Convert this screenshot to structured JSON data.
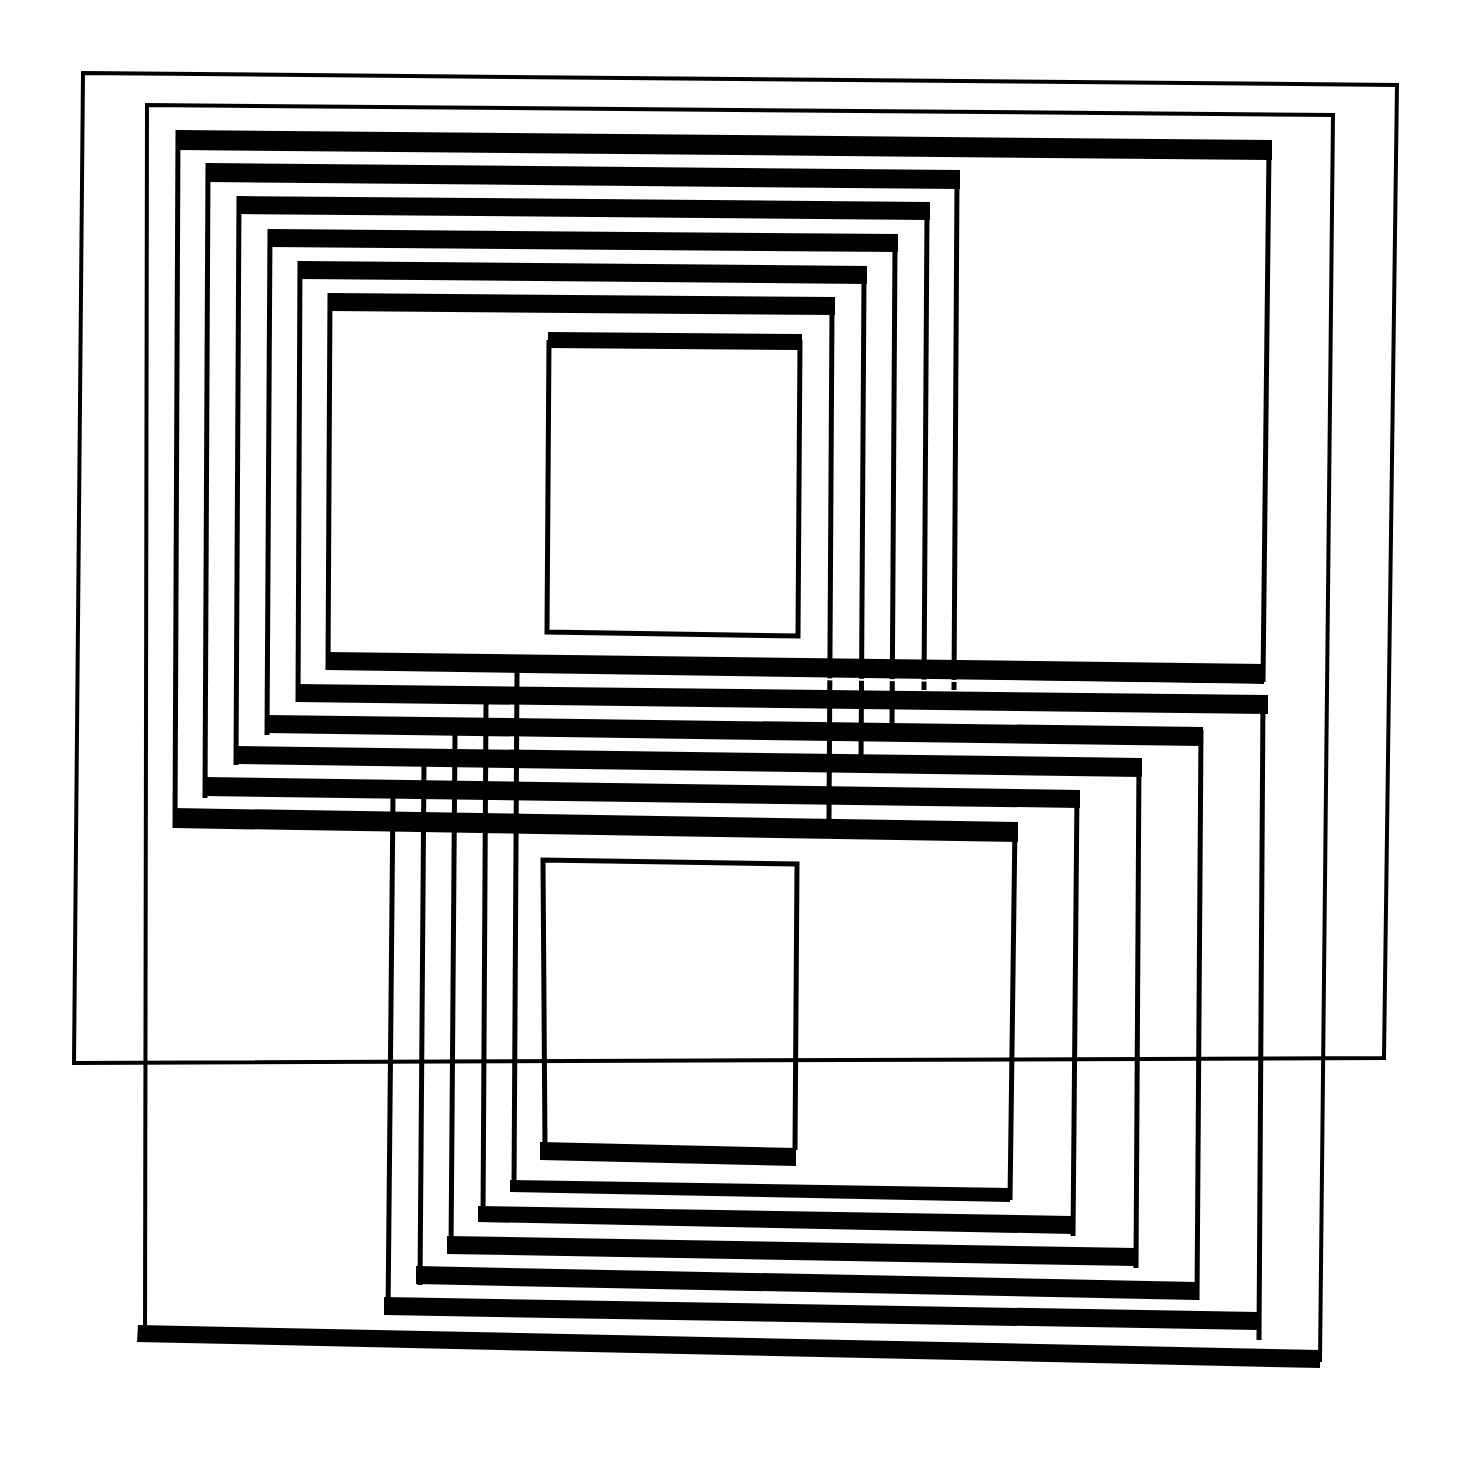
{
  "artwork": {
    "description": "Black-on-white geometric line artwork of interlocking nested rectangular frames",
    "colors": {
      "line": "#000000",
      "background": "#ffffff"
    },
    "outer_frames": [
      {
        "x1": 80,
        "y1": 72,
        "x2": 1395,
        "y2": 1060,
        "stroke": 4
      },
      {
        "x1": 145,
        "y1": 105,
        "x2": 1330,
        "y2": 1365,
        "stroke": 4
      }
    ],
    "upper_group_count": 6,
    "lower_group_count": 6,
    "inner_squares": [
      {
        "x": 548,
        "y": 333,
        "w": 252,
        "h": 300
      },
      {
        "x": 544,
        "y": 860,
        "w": 252,
        "h": 300
      }
    ]
  }
}
